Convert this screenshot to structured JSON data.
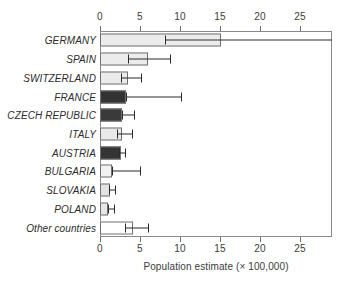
{
  "chart_data": {
    "type": "bar",
    "orientation": "horizontal",
    "title": "",
    "xlabel": "Population estimate (× 100,000)",
    "ylabel": "",
    "xlim": [
      0,
      29
    ],
    "xticks": [
      0,
      5,
      10,
      15,
      20,
      25
    ],
    "xtick_labels": [
      "0",
      "5",
      "10",
      "15",
      "20",
      "25"
    ],
    "grid": false,
    "legend": "none",
    "axis_top_ticks": true,
    "axis_bottom_ticks": true,
    "categories": [
      "GERMANY",
      "SPAIN",
      "SWITZERLAND",
      "FRANCE",
      "CZECH REPUBLIC",
      "ITALY",
      "AUSTRIA",
      "BULGARIA",
      "SLOVAKIA",
      "POLAND",
      "Other countries"
    ],
    "values": [
      15.1,
      6.0,
      3.5,
      3.3,
      2.8,
      2.8,
      2.6,
      1.5,
      1.3,
      1.0,
      4.1
    ],
    "error_low": [
      8.1,
      3.5,
      2.6,
      3.3,
      2.8,
      2.1,
      2.4,
      1.5,
      1.1,
      1.0,
      3.1
    ],
    "error_high": [
      29.0,
      8.8,
      5.1,
      10.1,
      4.2,
      4.0,
      3.1,
      5.0,
      1.9,
      1.7,
      6.0
    ],
    "bar_fills": [
      "#ececec",
      "#ececec",
      "#ebebeb",
      "#333333",
      "#3a3a3a",
      "#eaeaea",
      "#343434",
      "#f2f2f2",
      "#e3e3e3",
      "#e6e6e6",
      "#ffffff"
    ],
    "bar_edge_color": "#707070",
    "error_color": "#2a2a2a",
    "frame_color": "#8a8a8a",
    "background": "#ffffff"
  }
}
